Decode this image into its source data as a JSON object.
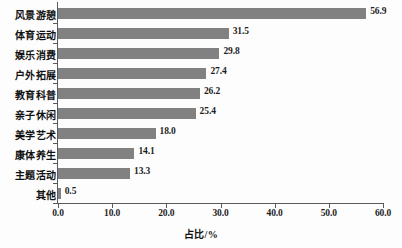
{
  "chart_data": {
    "type": "bar",
    "orientation": "horizontal",
    "title": "",
    "xlabel": "占比/%",
    "ylabel": "",
    "xlim": [
      0.0,
      60.0
    ],
    "xticks": [
      "0.0",
      "10.0",
      "20.0",
      "30.0",
      "40.0",
      "50.0",
      "60.0"
    ],
    "xtick_values": [
      0,
      10,
      20,
      30,
      40,
      50,
      60
    ],
    "grid": false,
    "legend": false,
    "bar_color": "#818181",
    "axis_color": "#5a5a5a",
    "categories": [
      "风景游憩",
      "体育运动",
      "娱乐消费",
      "户外拓展",
      "教育科普",
      "亲子休闲",
      "美学艺术",
      "康体养生",
      "主题活动",
      "其他"
    ],
    "values": [
      56.9,
      31.5,
      29.8,
      27.4,
      26.2,
      25.4,
      18.0,
      14.1,
      13.3,
      0.5
    ],
    "value_labels": [
      "56.9",
      "31.5",
      "29.8",
      "27.4",
      "26.2",
      "25.4",
      "18.0",
      "14.1",
      "13.3",
      "0.5"
    ]
  }
}
